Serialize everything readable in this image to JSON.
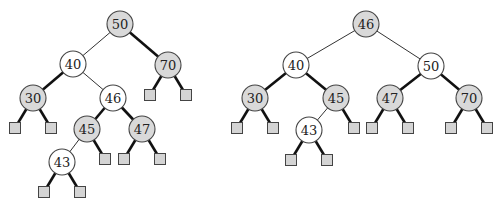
{
  "colors": {
    "red_node": "#ffffff",
    "black_node": "#d9d9d9",
    "leaf": "#d4d4d4"
  },
  "trees": [
    {
      "name": "tree-before",
      "nodes": [
        {
          "id": "50",
          "label": "50",
          "color": "black"
        },
        {
          "id": "40",
          "label": "40",
          "color": "red"
        },
        {
          "id": "70",
          "label": "70",
          "color": "black"
        },
        {
          "id": "30",
          "label": "30",
          "color": "black"
        },
        {
          "id": "46",
          "label": "46",
          "color": "red"
        },
        {
          "id": "45",
          "label": "45",
          "color": "black"
        },
        {
          "id": "47",
          "label": "47",
          "color": "black"
        },
        {
          "id": "43",
          "label": "43",
          "color": "red"
        }
      ],
      "edges": [
        {
          "from": "50",
          "to": "40",
          "kind": "thin"
        },
        {
          "from": "50",
          "to": "70",
          "kind": "thick"
        },
        {
          "from": "40",
          "to": "30",
          "kind": "thick"
        },
        {
          "from": "40",
          "to": "46",
          "kind": "thin"
        },
        {
          "from": "46",
          "to": "45",
          "kind": "thick"
        },
        {
          "from": "46",
          "to": "47",
          "kind": "thick"
        },
        {
          "from": "45",
          "to": "43",
          "kind": "thin"
        }
      ],
      "leaves": [
        {
          "parent": "70",
          "side": "left"
        },
        {
          "parent": "70",
          "side": "right"
        },
        {
          "parent": "30",
          "side": "left"
        },
        {
          "parent": "30",
          "side": "right"
        },
        {
          "parent": "45",
          "side": "right"
        },
        {
          "parent": "47",
          "side": "left"
        },
        {
          "parent": "47",
          "side": "right"
        },
        {
          "parent": "43",
          "side": "left"
        },
        {
          "parent": "43",
          "side": "right"
        }
      ]
    },
    {
      "name": "tree-after",
      "nodes": [
        {
          "id": "46",
          "label": "46",
          "color": "black"
        },
        {
          "id": "40",
          "label": "40",
          "color": "red"
        },
        {
          "id": "50",
          "label": "50",
          "color": "red"
        },
        {
          "id": "30",
          "label": "30",
          "color": "black"
        },
        {
          "id": "45",
          "label": "45",
          "color": "black"
        },
        {
          "id": "47",
          "label": "47",
          "color": "black"
        },
        {
          "id": "70",
          "label": "70",
          "color": "black"
        },
        {
          "id": "43",
          "label": "43",
          "color": "red"
        }
      ],
      "edges": [
        {
          "from": "46",
          "to": "40",
          "kind": "thin"
        },
        {
          "from": "46",
          "to": "50",
          "kind": "thin"
        },
        {
          "from": "40",
          "to": "30",
          "kind": "thick"
        },
        {
          "from": "40",
          "to": "45",
          "kind": "thick"
        },
        {
          "from": "50",
          "to": "47",
          "kind": "thick"
        },
        {
          "from": "50",
          "to": "70",
          "kind": "thick"
        },
        {
          "from": "45",
          "to": "43",
          "kind": "thin"
        }
      ],
      "leaves": [
        {
          "parent": "30",
          "side": "left"
        },
        {
          "parent": "30",
          "side": "right"
        },
        {
          "parent": "45",
          "side": "right"
        },
        {
          "parent": "47",
          "side": "left"
        },
        {
          "parent": "47",
          "side": "right"
        },
        {
          "parent": "70",
          "side": "left"
        },
        {
          "parent": "70",
          "side": "right"
        },
        {
          "parent": "43",
          "side": "left"
        },
        {
          "parent": "43",
          "side": "right"
        }
      ]
    }
  ]
}
